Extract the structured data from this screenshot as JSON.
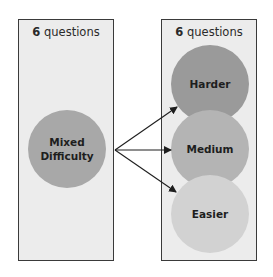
{
  "left_panel": {
    "count": "6",
    "label": "questions",
    "circle": {
      "line1": "Mixed",
      "line2": "Difficulty",
      "color": "#a8a8a8"
    }
  },
  "right_panel": {
    "count": "6",
    "label": "questions",
    "circles": [
      {
        "label": "Harder",
        "color": "#9a9a9a"
      },
      {
        "label": "Medium",
        "color": "#b4b4b4"
      },
      {
        "label": "Easier",
        "color": "#d2d2d2"
      }
    ]
  },
  "arrow_color": "#1e1e1e"
}
